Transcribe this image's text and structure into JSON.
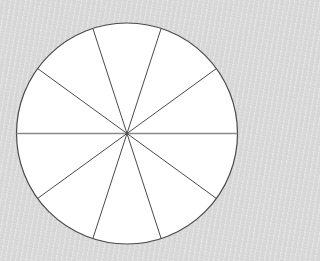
{
  "diagram": {
    "type": "divided-circle",
    "slices": 10,
    "slice_angle_deg": 36,
    "center": [
      127,
      133.5
    ],
    "radius": 110.5,
    "colors": {
      "fill": "#ffffff",
      "outline": "#4a4a4a",
      "spoke": "#4a4a4a",
      "horizontal_line": "#8a8a8a",
      "background": "#d6d6d6"
    }
  }
}
